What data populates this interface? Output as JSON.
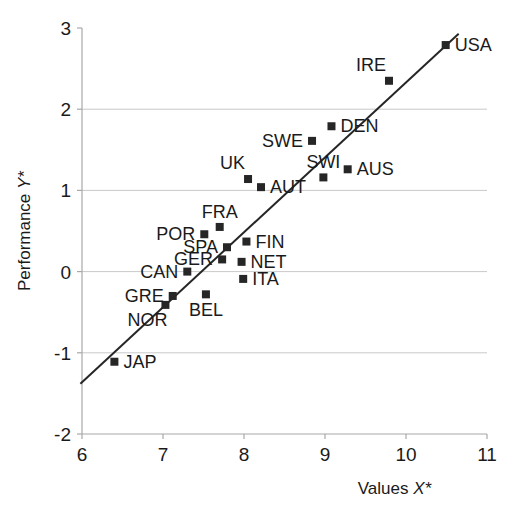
{
  "chart_data": {
    "type": "scatter",
    "title": "",
    "xlabel": "Values X*",
    "ylabel": "Performance Y*",
    "xlim": [
      6,
      11
    ],
    "ylim": [
      -2,
      3
    ],
    "xticks": [
      "6",
      "7",
      "8",
      "9",
      "10",
      "11"
    ],
    "yticks": [
      "3",
      "2",
      "1",
      "0",
      "-1",
      "-2"
    ],
    "xtick_values": [
      6,
      7,
      8,
      9,
      10,
      11
    ],
    "ytick_values": [
      3,
      2,
      1,
      0,
      -1,
      -2
    ],
    "grid": "horizontal gridlines at y = 2, 1, 0, -1",
    "legend": "none",
    "marker_style": "filled black square",
    "series": [
      {
        "name": "Countries",
        "points": [
          {
            "label": "USA",
            "x": 10.49,
            "y": 2.79,
            "label_pos": "right"
          },
          {
            "label": "IRE",
            "x": 9.79,
            "y": 2.35,
            "label_pos": "above-left"
          },
          {
            "label": "DEN",
            "x": 9.08,
            "y": 1.79,
            "label_pos": "right"
          },
          {
            "label": "SWE",
            "x": 8.84,
            "y": 1.61,
            "label_pos": "left"
          },
          {
            "label": "AUS",
            "x": 9.28,
            "y": 1.26,
            "label_pos": "right"
          },
          {
            "label": "SWI",
            "x": 8.98,
            "y": 1.16,
            "label_pos": "above"
          },
          {
            "label": "UK",
            "x": 8.05,
            "y": 1.14,
            "label_pos": "above-left"
          },
          {
            "label": "AUT",
            "x": 8.21,
            "y": 1.04,
            "label_pos": "right"
          },
          {
            "label": "FRA",
            "x": 7.7,
            "y": 0.55,
            "label_pos": "above"
          },
          {
            "label": "POR",
            "x": 7.51,
            "y": 0.46,
            "label_pos": "left"
          },
          {
            "label": "FIN",
            "x": 8.03,
            "y": 0.37,
            "label_pos": "right"
          },
          {
            "label": "SPA",
            "x": 7.79,
            "y": 0.3,
            "label_pos": "left"
          },
          {
            "label": "GER",
            "x": 7.73,
            "y": 0.15,
            "label_pos": "left"
          },
          {
            "label": "NET",
            "x": 7.97,
            "y": 0.12,
            "label_pos": "right"
          },
          {
            "label": "CAN",
            "x": 7.3,
            "y": 0.0,
            "label_pos": "left"
          },
          {
            "label": "ITA",
            "x": 7.99,
            "y": -0.09,
            "label_pos": "right"
          },
          {
            "label": "BEL",
            "x": 7.53,
            "y": -0.28,
            "label_pos": "below"
          },
          {
            "label": "GRE",
            "x": 7.12,
            "y": -0.3,
            "label_pos": "left"
          },
          {
            "label": "NOR",
            "x": 7.03,
            "y": -0.41,
            "label_pos": "below-left"
          },
          {
            "label": "JAP",
            "x": 6.4,
            "y": -1.11,
            "label_pos": "right"
          }
        ]
      }
    ],
    "trendline": {
      "type": "linear",
      "x_start": 5.98,
      "y_start": -1.38,
      "x_end": 10.65,
      "y_end": 2.93,
      "slope": 0.923,
      "intercept": -6.9
    }
  },
  "axis": {
    "x_title": "Values X*",
    "x_title_main": "Values",
    "x_title_var": "X*",
    "y_title": "Performance Y*",
    "y_title_main": "Performance",
    "y_title_var": "Y*"
  }
}
